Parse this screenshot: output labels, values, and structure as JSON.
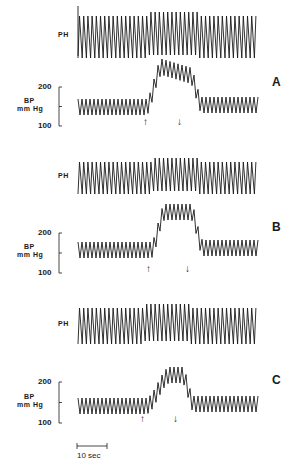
{
  "figure": {
    "trace_labels": {
      "ph": "PH",
      "bp_line1": "BP",
      "bp_line2": "mm Hg"
    },
    "scale_bar_label": "10 sec",
    "arrows": {
      "up": "↑",
      "down": "↓"
    }
  },
  "chart_data": [
    {
      "type": "line",
      "panel": "A",
      "title": "A",
      "series": [
        {
          "name": "PH",
          "description": "pulse/plethysmograph trace, oscillating; amplitude increases after stimulus onset then partially returns"
        },
        {
          "name": "BP",
          "unit": "mm Hg",
          "baseline_mean": 140,
          "baseline_range": [
            125,
            155
          ],
          "peak_mean": 190,
          "peak_max": 215,
          "post_mean": 145
        }
      ],
      "ylabel": "BP mm Hg",
      "yticks": [
        100,
        200
      ],
      "ylim": [
        100,
        200
      ],
      "events": [
        {
          "type": "onset",
          "marker": "up-arrow",
          "t_sec": 20
        },
        {
          "type": "offset",
          "marker": "down-arrow",
          "t_sec": 30
        }
      ],
      "xlabel": "time (scale bar 10 sec)"
    },
    {
      "type": "line",
      "panel": "B",
      "title": "B",
      "series": [
        {
          "name": "PH",
          "description": "pulse trace with increased amplitude during stimulus"
        },
        {
          "name": "BP",
          "unit": "mm Hg",
          "baseline_mean": 140,
          "baseline_range": [
            125,
            160
          ],
          "peak_mean": 205,
          "peak_max": 225,
          "post_mean": 150
        }
      ],
      "ylabel": "BP mm Hg",
      "yticks": [
        100,
        200
      ],
      "ylim": [
        100,
        200
      ],
      "events": [
        {
          "type": "onset",
          "marker": "up-arrow",
          "t_sec": 21
        },
        {
          "type": "offset",
          "marker": "down-arrow",
          "t_sec": 32
        }
      ]
    },
    {
      "type": "line",
      "panel": "C",
      "title": "C",
      "series": [
        {
          "name": "PH",
          "description": "pulse trace with slight amplitude increase during stimulus"
        },
        {
          "name": "BP",
          "unit": "mm Hg",
          "baseline_mean": 140,
          "baseline_range": [
            125,
            155
          ],
          "peak_mean": 195,
          "peak_max": 215,
          "post_mean": 140
        }
      ],
      "ylabel": "BP mm Hg",
      "yticks": [
        100,
        200
      ],
      "ylim": [
        100,
        200
      ],
      "events": [
        {
          "type": "onset",
          "marker": "up-arrow",
          "t_sec": 20
        },
        {
          "type": "offset",
          "marker": "down-arrow",
          "t_sec": 29
        }
      ]
    }
  ],
  "panels": [
    {
      "id": "A",
      "ph_top": 14,
      "ph_bottom": 58,
      "bp_y200": 87,
      "bp_y100": 126,
      "bp_base_y": 107,
      "bp_peak_y": 67,
      "ph_jump_x": 148,
      "rise_x": 146,
      "peak_x": 162,
      "fall_x": 190,
      "up_x": 145,
      "down_x": 179,
      "label_y": 75
    },
    {
      "id": "B",
      "ph_top": 160,
      "ph_bottom": 194,
      "bp_y200": 233,
      "bp_y100": 273,
      "bp_base_y": 250,
      "bp_peak_y": 212,
      "ph_jump_x": 151,
      "rise_x": 151,
      "peak_x": 165,
      "fall_x": 191,
      "up_x": 148,
      "down_x": 187,
      "label_y": 220
    },
    {
      "id": "C",
      "ph_top": 306,
      "ph_bottom": 344,
      "bp_y200": 382,
      "bp_y100": 423,
      "bp_base_y": 406,
      "bp_peak_y": 375,
      "ph_jump_x": 145,
      "rise_x": 146,
      "peak_x": 170,
      "fall_x": 182,
      "up_x": 142,
      "down_x": 175,
      "label_y": 373
    }
  ],
  "colors": {
    "ink": "#1a1a1a",
    "background": "#ffffff"
  }
}
